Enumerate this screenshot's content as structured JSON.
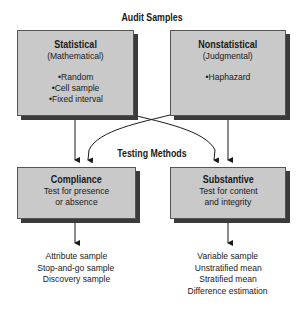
{
  "diagram": {
    "top_title": "Audit Samples",
    "middle_title": "Testing Methods",
    "boxes": {
      "statistical": {
        "heading": "Statistical",
        "subheading": "(Mathematical)",
        "items": [
          "•Random",
          "•Cell sample",
          "•Fixed interval"
        ]
      },
      "nonstatistical": {
        "heading": "Nonstatistical",
        "subheading": "(Judgmental)",
        "items": [
          "•Haphazard"
        ]
      },
      "compliance": {
        "heading": "Compliance",
        "lines": [
          "Test for presence",
          "or absence"
        ]
      },
      "substantive": {
        "heading": "Substantive",
        "lines": [
          "Test for content",
          "and integrity"
        ]
      }
    },
    "outputs": {
      "compliance": [
        "Attribute sample",
        "Stop-and-go sample",
        "Discovery sample"
      ],
      "substantive": [
        "Variable sample",
        "Unstratified mean",
        "Stratified mean",
        "Difference estimation"
      ]
    },
    "colors": {
      "box_fill": "#c9c9c9",
      "shadow": "#3a3a3a",
      "line": "#1a1a1a"
    }
  }
}
